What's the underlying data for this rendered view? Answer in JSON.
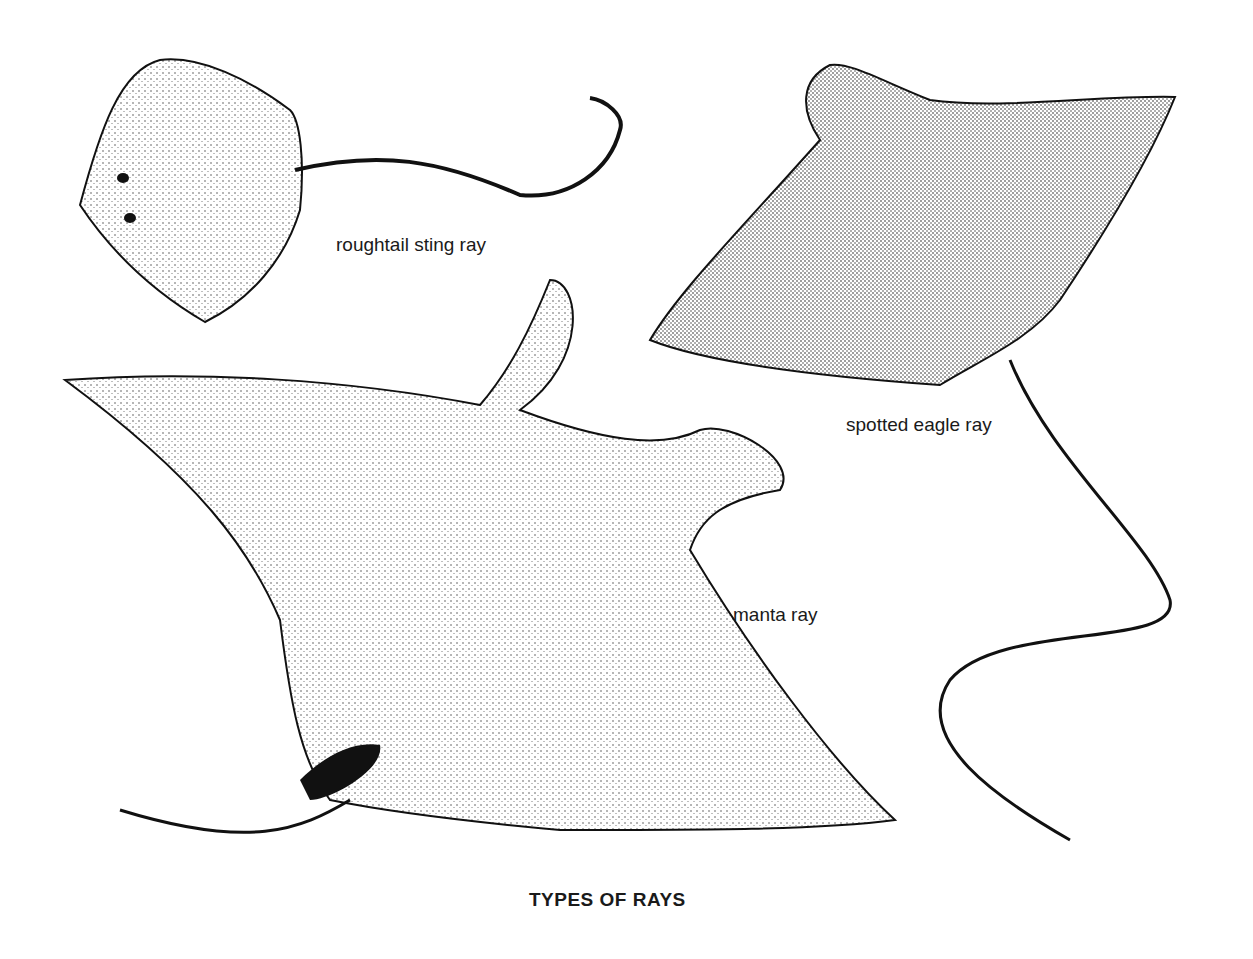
{
  "figure": {
    "caption": "TYPES OF RAYS",
    "labels": {
      "roughtail": "roughtail sting ray",
      "eagle": "spotted eagle ray",
      "manta": "manta ray"
    }
  },
  "colors": {
    "ink": "#1a1a1a",
    "background": "#ffffff"
  }
}
